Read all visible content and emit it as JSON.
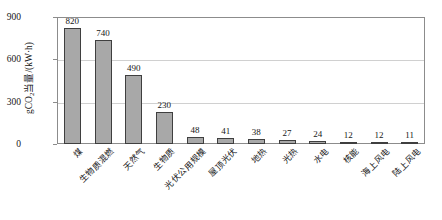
{
  "chart_data": {
    "type": "bar",
    "title": "",
    "subtitle": "",
    "xlabel": "",
    "ylabel": "gCO₂当量/(kW·h)",
    "ylabel_parts": {
      "prefix": "gCO",
      "subscript": "2",
      "suffix": "当量/(kW·h)"
    },
    "categories": [
      "煤",
      "生物质混燃",
      "天然气",
      "生物质",
      "光伏公用规模",
      "屋顶光伏",
      "地热",
      "光热",
      "水电",
      "核能",
      "海上风电",
      "陆上风电"
    ],
    "values": [
      820,
      740,
      490,
      230,
      48,
      41,
      38,
      27,
      24,
      12,
      12,
      11
    ],
    "value_labels": [
      "820",
      "740",
      "490",
      "230",
      "48",
      "41",
      "38",
      "27",
      "24",
      "12",
      "12",
      "11"
    ],
    "ylim": [
      0,
      900
    ],
    "yticks": [
      0,
      300,
      600,
      900
    ],
    "ytick_labels": [
      "0",
      "300",
      "600",
      "900"
    ],
    "grid": true,
    "grid_axis": "y",
    "legend": false,
    "legend_position": "none",
    "bar_color": "#a8a8a8",
    "bar_edge_color": "#3f3f3f",
    "grid_color": "#d0d0d0",
    "frame_color": "#8c8c8c",
    "text_color": "#161616",
    "background": "#ffffff",
    "xtick_label_rotation": 45
  }
}
